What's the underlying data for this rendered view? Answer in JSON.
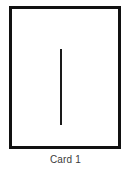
{
  "figure": {
    "caption": "Card 1",
    "card": {
      "border_color": "#111111",
      "face_color": "#ffffff",
      "border_width_px": 3
    },
    "stimulus": {
      "kind": "vertical-line",
      "color": "#1a1a1a",
      "orientation": "vertical",
      "count": 1
    },
    "background_color": "#ffffff"
  },
  "chart_data": {
    "type": "scatter",
    "title": "Card 1",
    "xlabel": "",
    "ylabel": "",
    "x": [
      57
    ],
    "y": [
      84
    ],
    "series": [
      {
        "name": "vertical line segment",
        "x_start": 57,
        "y_start": 46,
        "x_end": 57,
        "y_end": 122
      }
    ],
    "xlim": [
      9,
      121
    ],
    "ylim": [
      6,
      149
    ],
    "grid": false,
    "legend": "none",
    "annotations": [
      "Card 1"
    ]
  }
}
